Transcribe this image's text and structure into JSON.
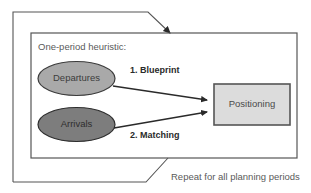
{
  "diagram": {
    "title_text": "One-period heuristic:",
    "outer_loop_caption": "Repeat for all planning periods",
    "nodes": [
      {
        "id": "departures",
        "label": "Departures",
        "shape": "ellipse",
        "fill": "#a9a9a9",
        "stroke": "#3c3c3c"
      },
      {
        "id": "arrivals",
        "label": "Arrivals",
        "shape": "ellipse",
        "fill": "#7d7d7d",
        "stroke": "#2e2e2e"
      },
      {
        "id": "positioning",
        "label": "Positioning",
        "shape": "rectangle",
        "fill": "#dcdcdc",
        "stroke": "#555555"
      }
    ],
    "edges": [
      {
        "id": "blueprint",
        "label": "1. Blueprint",
        "from": "departures",
        "to": "positioning"
      },
      {
        "id": "matching",
        "label": "2. Matching",
        "from": "arrivals",
        "to": "positioning"
      }
    ],
    "colors": {
      "background": "#ffffff",
      "inner_box_stroke": "#555555",
      "outer_loop_stroke": "#555555",
      "text": "#4a4a4a"
    }
  }
}
